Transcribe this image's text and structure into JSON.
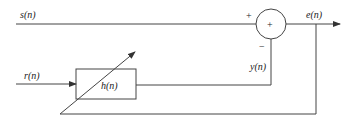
{
  "diagram": {
    "type": "adaptive-filter-block-diagram",
    "signals": {
      "input_desired": "s(n)",
      "input_reference": "r(n)",
      "filter_output": "y(n)",
      "error_output": "e(n)"
    },
    "filter": {
      "label": "h(n)"
    },
    "summing_junction": {
      "symbol": "+",
      "plus_input_sign": "+",
      "minus_input_sign": "−"
    },
    "colors": {
      "line": "#444444",
      "text": "#222222",
      "background": "#ffffff"
    }
  }
}
